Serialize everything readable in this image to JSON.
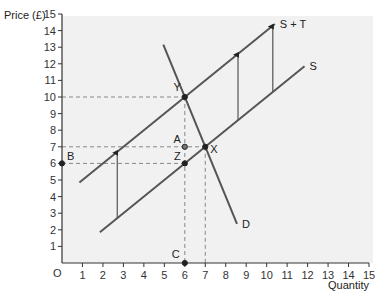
{
  "chart_data": {
    "type": "line",
    "title": "",
    "xlabel": "Quantity",
    "ylabel": "Price (£)",
    "origin_label": "O",
    "xlim": [
      0,
      15
    ],
    "ylim": [
      0,
      15
    ],
    "xticks": [
      1,
      2,
      3,
      4,
      5,
      6,
      7,
      8,
      9,
      10,
      11,
      12,
      13,
      14,
      15
    ],
    "yticks": [
      1,
      2,
      3,
      4,
      5,
      6,
      7,
      8,
      9,
      10,
      11,
      12,
      13,
      14,
      15
    ],
    "grid": false,
    "series": [
      {
        "name": "S",
        "points": [
          [
            1.85,
            1.85
          ],
          [
            11.85,
            11.85
          ]
        ]
      },
      {
        "name": "S + T",
        "points": [
          [
            0.85,
            4.85
          ],
          [
            10.4,
            14.4
          ]
        ]
      },
      {
        "name": "D",
        "points": [
          [
            4.95,
            13.15
          ],
          [
            8.55,
            2.35
          ]
        ]
      }
    ],
    "arrows": [
      {
        "x": 2.7,
        "from": 2.7,
        "to": 6.7
      },
      {
        "x": 8.6,
        "from": 8.6,
        "to": 12.6
      },
      {
        "x": 10.3,
        "from": 10.3,
        "to": 14.3
      }
    ],
    "points": [
      {
        "label": "Y",
        "x": 6,
        "y": 10
      },
      {
        "label": "X",
        "x": 7,
        "y": 7
      },
      {
        "label": "A",
        "x": 6,
        "y": 7,
        "hollow": true
      },
      {
        "label": "Z",
        "x": 6,
        "y": 6
      },
      {
        "label": "B",
        "x": 0,
        "y": 6
      },
      {
        "label": "C",
        "x": 6,
        "y": 0
      }
    ],
    "guides": [
      {
        "from": [
          0,
          10
        ],
        "to": [
          6,
          10
        ]
      },
      {
        "from": [
          6,
          10
        ],
        "to": [
          6,
          0
        ]
      },
      {
        "from": [
          0,
          7
        ],
        "to": [
          7,
          7
        ]
      },
      {
        "from": [
          7,
          7
        ],
        "to": [
          7,
          0
        ]
      },
      {
        "from": [
          0,
          6
        ],
        "to": [
          6,
          6
        ]
      }
    ],
    "colors": {
      "curve": "#555555",
      "guide": "#888888",
      "point": "#222222",
      "plot_bg": "#f1f1f1"
    }
  }
}
